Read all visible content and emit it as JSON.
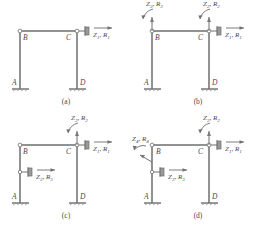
{
  "figure": {
    "type": "structural-frame-load-cases",
    "line_color": "#6e6e6e",
    "text_color": "#4a4a4a",
    "background": "#ffffff",
    "panels": [
      {
        "caption": "(a)",
        "joint_labels": [
          "B",
          "C",
          "A",
          "D"
        ],
        "loads": [
          {
            "name": "horizontal-force-at-c",
            "text": "Z",
            "sub": "1",
            "text2": "R",
            "sub2": "1",
            "kind": "translational"
          }
        ]
      },
      {
        "caption": "(b)",
        "joint_labels": [
          "B",
          "C",
          "A",
          "D"
        ],
        "loads": [
          {
            "name": "moment-at-b",
            "text": "Z",
            "sub": "3",
            "text2": "R",
            "sub2": "3",
            "kind": "rotational"
          },
          {
            "name": "moment-at-c",
            "text": "Z",
            "sub": "2",
            "text2": "R",
            "sub2": "2",
            "kind": "rotational"
          },
          {
            "name": "horizontal-force-at-c",
            "text": "Z",
            "sub": "1",
            "text2": "R",
            "sub2": "1",
            "kind": "translational"
          }
        ]
      },
      {
        "caption": "(c)",
        "joint_labels": [
          "B",
          "C",
          "A",
          "D"
        ],
        "loads": [
          {
            "name": "moment-at-c",
            "text": "Z",
            "sub": "2",
            "text2": "R",
            "sub2": "2",
            "kind": "rotational"
          },
          {
            "name": "horizontal-force-at-c",
            "text": "Z",
            "sub": "1",
            "text2": "R",
            "sub2": "1",
            "kind": "translational"
          },
          {
            "name": "horizontal-force-at-left-column",
            "text": "Z",
            "sub": "3",
            "text2": "R",
            "sub2": "3",
            "kind": "translational"
          }
        ]
      },
      {
        "caption": "(d)",
        "joint_labels": [
          "B",
          "C",
          "A",
          "D"
        ],
        "loads": [
          {
            "name": "moment-at-c",
            "text": "Z",
            "sub": "2",
            "text2": "R",
            "sub2": "2",
            "kind": "rotational"
          },
          {
            "name": "horizontal-force-at-c",
            "text": "Z",
            "sub": "1",
            "text2": "R",
            "sub2": "1",
            "kind": "translational"
          },
          {
            "name": "horizontal-force-at-left-column",
            "text": "Z",
            "sub": "3",
            "text2": "R",
            "sub2": "3",
            "kind": "translational"
          },
          {
            "name": "moment-at-left-column",
            "text": "Z",
            "sub": "4",
            "text2": "R",
            "sub2": "4",
            "kind": "rotational"
          }
        ]
      }
    ]
  },
  "labels": {
    "a": {
      "B": "B",
      "C": "C",
      "A": "A",
      "D": "D",
      "caption": "(a)",
      "z1": "Z",
      "z1s": "1",
      "r1": "R",
      "r1s": "1"
    },
    "b": {
      "B": "B",
      "C": "C",
      "A": "A",
      "D": "D",
      "caption": "(b)",
      "z1": "Z",
      "z1s": "1",
      "r1": "R",
      "r1s": "1",
      "z2": "Z",
      "z2s": "2",
      "r2": "R",
      "r2s": "2",
      "z3": "Z",
      "z3s": "3",
      "r3": "R",
      "r3s": "3"
    },
    "c": {
      "B": "B",
      "C": "C",
      "A": "A",
      "D": "D",
      "caption": "(c)",
      "z1": "Z",
      "z1s": "1",
      "r1": "R",
      "r1s": "1",
      "z2": "Z",
      "z2s": "2",
      "r2": "R",
      "r2s": "2",
      "z3": "Z",
      "z3s": "3",
      "r3": "R",
      "r3s": "3"
    },
    "d": {
      "B": "B",
      "C": "C",
      "A": "A",
      "D": "D",
      "caption": "(d)",
      "z1": "Z",
      "z1s": "1",
      "r1": "R",
      "r1s": "1",
      "z2": "Z",
      "z2s": "2",
      "r2": "R",
      "r2s": "2",
      "z3": "Z",
      "z3s": "3",
      "r3": "R",
      "r3s": "3",
      "z4": "Z",
      "z4s": "4",
      "r4": "R",
      "r4s": "4"
    }
  }
}
